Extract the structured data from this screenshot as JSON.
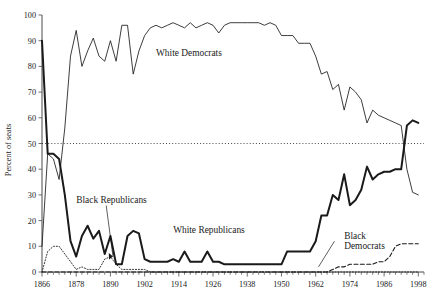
{
  "chart_data": {
    "type": "line",
    "title": "",
    "subtitle": "",
    "xlabel": "",
    "ylabel": "Percent of seats",
    "xlim": [
      1866,
      2000
    ],
    "ylim": [
      0,
      100
    ],
    "grid": false,
    "legend_position": "inline-annotations",
    "x_ticks": [
      1866,
      1878,
      1890,
      1902,
      1914,
      1926,
      1938,
      1950,
      1962,
      1974,
      1986,
      1998
    ],
    "x_tick_labels": [
      "1866",
      "1878",
      "1890",
      "1902",
      "1914",
      "1926",
      "1938",
      "1950",
      "1962",
      "1974",
      "1986",
      "1998"
    ],
    "y_ticks": [
      0,
      10,
      20,
      30,
      40,
      50,
      60,
      70,
      80,
      90,
      100
    ],
    "y_tick_labels": [
      "0",
      "10",
      "20",
      "30",
      "40",
      "50",
      "60",
      "70",
      "80",
      "90",
      "100"
    ],
    "reference_lines": [
      {
        "name": "fifty-percent-line",
        "axis": "y",
        "value": 50,
        "style": "dotted"
      }
    ],
    "annotations": [
      {
        "name": "white-democrats-label",
        "text": "White Democrats",
        "x": 1906,
        "y": 84,
        "style": "plain"
      },
      {
        "name": "black-republicans-label",
        "text": "Black Republicans",
        "x": 1878,
        "y": 27,
        "style": "leader"
      },
      {
        "name": "white-republicans-label",
        "text": "White Republicans",
        "x": 1912,
        "y": 15,
        "style": "plain"
      },
      {
        "name": "black-democrats-line1",
        "text": "Black",
        "x": 1972,
        "y": 13,
        "style": "plain"
      },
      {
        "name": "black-democrats-line2",
        "text": "Democrats",
        "x": 1972,
        "y": 9,
        "style": "plain"
      }
    ],
    "series": [
      {
        "name": "White Democrats",
        "style": "thin-solid",
        "x": [
          1866,
          1868,
          1870,
          1872,
          1874,
          1876,
          1878,
          1880,
          1882,
          1884,
          1886,
          1888,
          1890,
          1892,
          1894,
          1896,
          1898,
          1900,
          1902,
          1904,
          1906,
          1908,
          1910,
          1912,
          1914,
          1916,
          1918,
          1920,
          1922,
          1924,
          1926,
          1928,
          1930,
          1932,
          1934,
          1936,
          1938,
          1940,
          1942,
          1944,
          1946,
          1948,
          1950,
          1952,
          1954,
          1956,
          1958,
          1960,
          1962,
          1964,
          1966,
          1968,
          1970,
          1972,
          1974,
          1976,
          1978,
          1980,
          1982,
          1984,
          1986,
          1988,
          1990,
          1992,
          1994,
          1996,
          1998
        ],
        "values": [
          10,
          46,
          44,
          36,
          56,
          84,
          94,
          80,
          86,
          91,
          84,
          82,
          90,
          82,
          96,
          96,
          77,
          86,
          92,
          95,
          96,
          95,
          96,
          97,
          96,
          95,
          97,
          95,
          96,
          97,
          96,
          93,
          96,
          97,
          97,
          97,
          97,
          97,
          97,
          96,
          97,
          96,
          92,
          92,
          92,
          89,
          89,
          89,
          84,
          77,
          78,
          71,
          73,
          63,
          72,
          70,
          67,
          58,
          63,
          61,
          60,
          59,
          58,
          57,
          40,
          31,
          30
        ]
      },
      {
        "name": "White Republicans",
        "style": "thick-solid",
        "x": [
          1866,
          1868,
          1870,
          1872,
          1874,
          1876,
          1878,
          1880,
          1882,
          1884,
          1886,
          1888,
          1890,
          1892,
          1894,
          1896,
          1898,
          1900,
          1902,
          1904,
          1906,
          1908,
          1910,
          1912,
          1914,
          1916,
          1918,
          1920,
          1922,
          1924,
          1926,
          1928,
          1930,
          1932,
          1934,
          1936,
          1938,
          1940,
          1942,
          1944,
          1946,
          1948,
          1950,
          1952,
          1954,
          1956,
          1958,
          1960,
          1962,
          1964,
          1966,
          1968,
          1970,
          1972,
          1974,
          1976,
          1978,
          1980,
          1982,
          1984,
          1986,
          1988,
          1990,
          1992,
          1994,
          1996,
          1998
        ],
        "values": [
          90,
          46,
          46,
          44,
          30,
          12,
          6,
          14,
          18,
          13,
          16,
          7,
          14,
          3,
          3,
          14,
          16,
          15,
          5,
          4,
          4,
          4,
          4,
          5,
          4,
          8,
          4,
          4,
          4,
          8,
          4,
          4,
          3,
          3,
          3,
          3,
          3,
          3,
          3,
          3,
          3,
          3,
          3,
          8,
          8,
          8,
          8,
          8,
          12,
          22,
          22,
          30,
          28,
          38,
          26,
          28,
          32,
          41,
          36,
          38,
          39,
          39,
          40,
          40,
          57,
          59,
          58
        ]
      },
      {
        "name": "Black Republicans",
        "style": "dotted",
        "x": [
          1866,
          1868,
          1870,
          1872,
          1874,
          1876,
          1878,
          1880,
          1882,
          1884,
          1886,
          1888,
          1890,
          1892,
          1894,
          1896,
          1898,
          1900,
          1902,
          1904,
          1906,
          1908,
          1910,
          1912,
          1914,
          1916,
          1918,
          1920,
          1922,
          1924,
          1926,
          1928,
          1930,
          1932,
          1934,
          1936,
          1938,
          1940,
          1942,
          1944,
          1946,
          1948,
          1950,
          1952,
          1954,
          1956,
          1958,
          1960,
          1962,
          1964,
          1966,
          1968,
          1970,
          1972,
          1974,
          1976,
          1978,
          1980,
          1982,
          1984,
          1986,
          1988,
          1990,
          1992,
          1994,
          1996,
          1998
        ],
        "values": [
          0,
          8,
          10,
          10,
          7,
          4,
          1,
          2,
          1,
          1,
          1,
          5,
          6,
          3,
          1,
          1,
          1,
          1,
          1,
          0,
          0,
          0,
          0,
          0,
          0,
          0,
          0,
          0,
          0,
          0,
          0,
          0,
          0,
          0,
          0,
          0,
          0,
          0,
          0,
          0,
          0,
          0,
          0,
          0,
          0,
          0,
          0,
          0,
          0,
          0,
          0,
          0,
          0,
          0,
          0,
          0,
          0,
          0,
          0,
          0,
          0,
          0,
          0,
          0,
          0,
          0,
          0
        ]
      },
      {
        "name": "Black Democrats",
        "style": "dashed",
        "x": [
          1866,
          1868,
          1870,
          1872,
          1874,
          1876,
          1878,
          1880,
          1882,
          1884,
          1886,
          1888,
          1890,
          1892,
          1894,
          1896,
          1898,
          1900,
          1902,
          1904,
          1906,
          1908,
          1910,
          1912,
          1914,
          1916,
          1918,
          1920,
          1922,
          1924,
          1926,
          1928,
          1930,
          1932,
          1934,
          1936,
          1938,
          1940,
          1942,
          1944,
          1946,
          1948,
          1950,
          1952,
          1954,
          1956,
          1958,
          1960,
          1962,
          1964,
          1966,
          1968,
          1970,
          1972,
          1974,
          1976,
          1978,
          1980,
          1982,
          1984,
          1986,
          1988,
          1990,
          1992,
          1994,
          1996,
          1998
        ],
        "values": [
          0,
          0,
          0,
          0,
          0,
          0,
          0,
          0,
          0,
          0,
          0,
          0,
          0,
          0,
          0,
          0,
          0,
          0,
          0,
          0,
          0,
          0,
          0,
          0,
          0,
          0,
          0,
          0,
          0,
          0,
          0,
          0,
          0,
          0,
          0,
          0,
          0,
          0,
          0,
          0,
          0,
          0,
          0,
          0,
          0,
          0,
          0,
          0,
          0,
          0,
          0,
          1,
          2,
          2,
          3,
          3,
          3,
          3,
          3,
          4,
          4,
          6,
          10,
          11,
          11,
          11,
          11
        ]
      }
    ]
  }
}
